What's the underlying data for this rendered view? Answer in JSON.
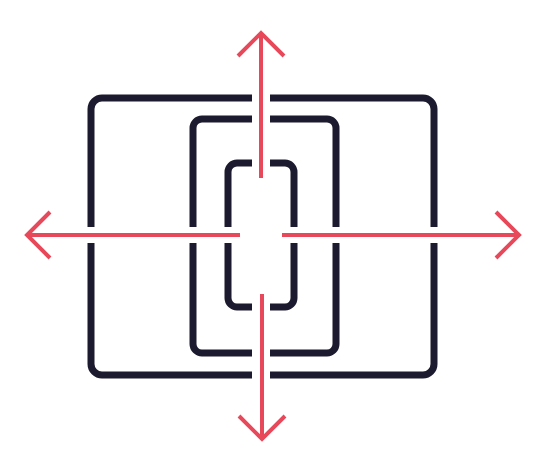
{
  "diagram": {
    "colors": {
      "background": "#ffffff",
      "frame": "#1c1a2e",
      "arrow": "#e8495a"
    },
    "frames": [
      {
        "name": "outer-frame",
        "x": 88,
        "y": 95,
        "w": 349,
        "h": 283,
        "r": 12
      },
      {
        "name": "middle-frame",
        "x": 190,
        "y": 116,
        "w": 149,
        "h": 240,
        "r": 10
      },
      {
        "name": "inner-frame",
        "x": 225,
        "y": 160,
        "w": 72,
        "h": 150,
        "r": 10
      }
    ],
    "arrows": [
      {
        "name": "arrow-up",
        "direction": "up"
      },
      {
        "name": "arrow-down",
        "direction": "down"
      },
      {
        "name": "arrow-left",
        "direction": "left"
      },
      {
        "name": "arrow-right",
        "direction": "right"
      }
    ]
  }
}
